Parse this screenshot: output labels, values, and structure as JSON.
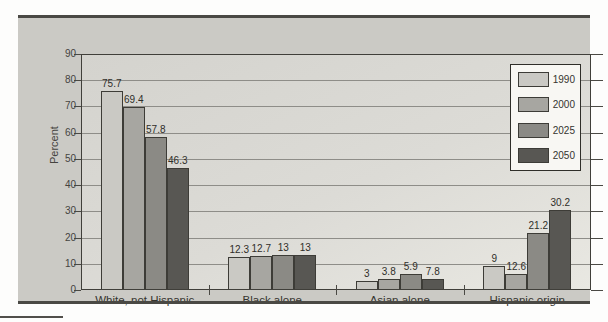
{
  "figure": {
    "y_axis_title": "Percent"
  },
  "chart_data": {
    "type": "bar",
    "title": "",
    "xlabel": "",
    "ylabel": "Percent",
    "ylim": [
      0,
      90
    ],
    "ytick_step": 10,
    "grid": true,
    "legend_position": "top-right",
    "categories": [
      "White, not Hispanic",
      "Black alone",
      "Asian alone",
      "Hispanic origin"
    ],
    "series": [
      {
        "name": "1990",
        "color": "#cac9c4",
        "values": [
          75.7,
          12.3,
          3,
          9
        ],
        "value_labels": [
          "75.7",
          "12.3",
          "3",
          "9"
        ],
        "drawn_heights": [
          75.7,
          12.3,
          3,
          8.8
        ]
      },
      {
        "name": "2000",
        "color": "#a7a6a1",
        "values": [
          69.4,
          12.7,
          3.8,
          12.6
        ],
        "value_labels": [
          "69.4",
          "12.7",
          "3.8",
          "12.6"
        ],
        "drawn_heights": [
          69.4,
          12.7,
          3.8,
          5.7
        ]
      },
      {
        "name": "2025",
        "color": "#8b8a85",
        "values": [
          57.8,
          13,
          5.9,
          21.2
        ],
        "value_labels": [
          "57.8",
          "13",
          "5.9",
          "21.2"
        ],
        "drawn_heights": [
          57.8,
          13,
          5.9,
          21.2
        ]
      },
      {
        "name": "2050",
        "color": "#585753",
        "values": [
          46.3,
          13,
          7.8,
          30.2
        ],
        "value_labels": [
          "46.3",
          "13",
          "7.8",
          "30.2"
        ],
        "drawn_heights": [
          46.3,
          13,
          3.7,
          30.2
        ]
      }
    ]
  }
}
